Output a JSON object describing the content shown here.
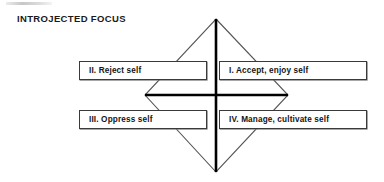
{
  "figure": {
    "title": "INTROJECTED FOCUS",
    "width": 384,
    "height": 182,
    "background_color": "#ffffff"
  },
  "colors": {
    "text": "#141414",
    "title_text": "#1a1a1a",
    "box_border": "#3a3a3a",
    "box_fill": "#ffffff",
    "axis_line": "#000000",
    "diamond_line": "#555555"
  },
  "diagram": {
    "type": "quadrant-diamond",
    "center": {
      "x": 216,
      "y": 95
    },
    "diamond_vertices": {
      "top": {
        "x": 216,
        "y": 19
      },
      "right": {
        "x": 288,
        "y": 95
      },
      "bottom": {
        "x": 216,
        "y": 172
      },
      "left": {
        "x": 145,
        "y": 95
      }
    },
    "vertical_axis": {
      "x": 216,
      "y1": 19,
      "y2": 172
    },
    "horizontal_axis": {
      "y": 95,
      "x1": 145,
      "x2": 288
    }
  },
  "quadrants": [
    {
      "id": "quadrant-1",
      "numeral": "I.",
      "label": "I. Accept, enjoy self",
      "position": "upper-right"
    },
    {
      "id": "quadrant-2",
      "numeral": "II.",
      "label": "II. Reject self",
      "position": "upper-left"
    },
    {
      "id": "quadrant-3",
      "numeral": "III.",
      "label": "III. Oppress self",
      "position": "lower-left"
    },
    {
      "id": "quadrant-4",
      "numeral": "IV.",
      "label": "IV. Manage, cultivate self",
      "position": "lower-right"
    }
  ]
}
